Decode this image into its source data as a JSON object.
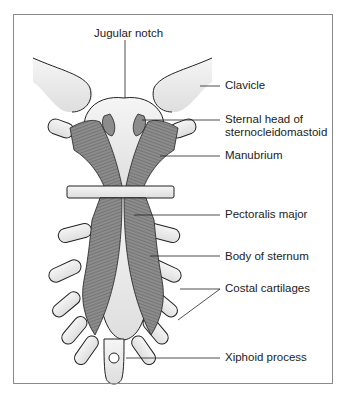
{
  "figure": {
    "type": "anatomical-diagram",
    "labels": [
      {
        "id": "jugular_notch",
        "text": "Jugular notch"
      },
      {
        "id": "clavicle",
        "text": "Clavicle"
      },
      {
        "id": "sternal_head_line1",
        "text": "Sternal head of"
      },
      {
        "id": "sternal_head_line2",
        "text": "sternocleidomastoid"
      },
      {
        "id": "manubrium",
        "text": "Manubrium"
      },
      {
        "id": "pectoralis_major",
        "text": "Pectoralis major"
      },
      {
        "id": "body_of_sternum",
        "text": "Body of sternum"
      },
      {
        "id": "costal_cartilages",
        "text": "Costal cartilages"
      },
      {
        "id": "xiphoid_process",
        "text": "Xiphoid process"
      }
    ],
    "colors": {
      "border": "#8a8a8a",
      "bone_fill": "#ebebeb",
      "muscle_fill": "#8c8c8c",
      "outline": "#222222",
      "text": "#222222"
    }
  }
}
